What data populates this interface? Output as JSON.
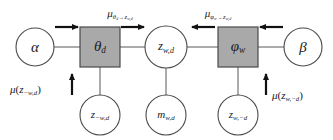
{
  "figure": {
    "kind": "factor-graph-message-passing",
    "width": 333,
    "height": 140,
    "background_color": "#ffffff",
    "stroke_color": "#404040",
    "text_color": "#1a1a1a",
    "factor_fill_color": "#a9a9a9",
    "variable_fill_color": "#ffffff"
  },
  "nodes": {
    "alpha": {
      "id": "alpha",
      "shape": "circle",
      "label_main": "α",
      "label_sub": "",
      "cx": 35,
      "cy": 47,
      "r": 19,
      "filled": false
    },
    "theta_d": {
      "id": "theta-d",
      "shape": "square",
      "label_main": "θ",
      "label_sub": "d",
      "cx": 100,
      "cy": 47,
      "size": 40,
      "filled": true
    },
    "z_wd": {
      "id": "z-w-d",
      "shape": "circle",
      "label_main": "z",
      "label_sub": "w,d",
      "cx": 166,
      "cy": 47,
      "r": 21,
      "filled": false
    },
    "phi_w": {
      "id": "phi-w",
      "shape": "square",
      "label_main": "φ",
      "label_sub": "w",
      "cx": 238,
      "cy": 47,
      "size": 40,
      "filled": true
    },
    "beta": {
      "id": "beta",
      "shape": "circle",
      "label_main": "β",
      "label_sub": "",
      "cx": 303,
      "cy": 47,
      "r": 19,
      "filled": false
    },
    "z_minus_w_d": {
      "id": "z-minus-w-d",
      "shape": "circle",
      "label_main": "z",
      "label_sub": "−w,d",
      "cx": 100,
      "cy": 115,
      "r": 20,
      "filled": false
    },
    "m_wd": {
      "id": "m-w-d",
      "shape": "circle",
      "label_main": "m",
      "label_sub": "w,d",
      "cx": 166,
      "cy": 115,
      "r": 20,
      "filled": false
    },
    "z_w_minus_d": {
      "id": "z-w-minus-d",
      "shape": "circle",
      "label_main": "z",
      "label_sub": "w,−d",
      "cx": 238,
      "cy": 115,
      "r": 20,
      "filled": false
    }
  },
  "messages": {
    "alpha_to_theta": {
      "id": "msg-alpha-to-theta",
      "direction": "right",
      "x1": 55,
      "x2": 82,
      "y": 27
    },
    "theta_to_z": {
      "id": "msg-theta-to-z",
      "mu": "μ",
      "from_main": "θ",
      "from_sub": "d",
      "arrow": "→",
      "to_main": "z",
      "to_sub": "w,d",
      "direction": "right",
      "x1": 121,
      "x2": 148,
      "y": 27,
      "label_x": 120,
      "label_y": 11
    },
    "phi_to_z": {
      "id": "msg-phi-to-z",
      "mu": "μ",
      "from_main": "φ",
      "from_sub": "w",
      "arrow": "→",
      "to_main": "z",
      "to_sub": "w,d",
      "direction": "left",
      "x1": 215,
      "x2": 188,
      "y": 27,
      "label_x": 218,
      "label_y": 11
    },
    "beta_to_phi": {
      "id": "msg-beta-to-phi",
      "direction": "left",
      "x1": 283,
      "x2": 256,
      "y": 27
    },
    "z_minus_w_d_up": {
      "id": "msg-z-minus-w-d-up",
      "mu": "μ",
      "open": "(",
      "var_main": "z",
      "var_sub": "−w,d",
      "close": ")",
      "direction": "up",
      "x": 72,
      "y1": 94,
      "y2": 72,
      "label_x": 12,
      "label_y": 88
    },
    "z_w_minus_d_up": {
      "id": "msg-z-w-minus-d-up",
      "mu": "μ",
      "open": "(",
      "var_main": "z",
      "var_sub": "w,−d",
      "close": ")",
      "direction": "up",
      "x": 266,
      "y1": 94,
      "y2": 72,
      "label_x": 275,
      "label_y": 92
    }
  },
  "edges": [
    {
      "id": "edge-alpha-theta",
      "x1": 54,
      "y1": 47,
      "x2": 80,
      "y2": 47
    },
    {
      "id": "edge-theta-z",
      "x1": 120,
      "y1": 47,
      "x2": 145,
      "y2": 47
    },
    {
      "id": "edge-z-phi",
      "x1": 187,
      "y1": 47,
      "x2": 218,
      "y2": 47
    },
    {
      "id": "edge-phi-beta",
      "x1": 258,
      "y1": 47,
      "x2": 284,
      "y2": 47
    },
    {
      "id": "edge-theta-zminuswd",
      "x1": 100,
      "y1": 67,
      "x2": 100,
      "y2": 95
    },
    {
      "id": "edge-z-mwd",
      "x1": 166,
      "y1": 68,
      "x2": 166,
      "y2": 95
    },
    {
      "id": "edge-phi-zwminusd",
      "x1": 238,
      "y1": 67,
      "x2": 238,
      "y2": 95
    }
  ]
}
